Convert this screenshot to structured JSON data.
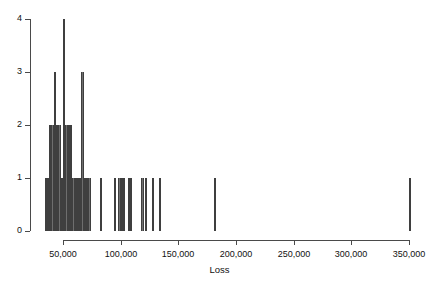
{
  "chart_data": {
    "type": "bar",
    "title": "",
    "subtitle": "",
    "xlabel": "Loss",
    "ylabel": "",
    "legend": [],
    "legend_position": "none",
    "grid": false,
    "xlim": [
      32000,
      356000
    ],
    "ylim": [
      0,
      4
    ],
    "x_ticks": [
      50000,
      100000,
      150000,
      200000,
      250000,
      300000,
      350000
    ],
    "x_tick_labels": [
      "50,000",
      "100,000",
      "150,000",
      "200,000",
      "250,000",
      "300,000",
      "350,000"
    ],
    "y_ticks": [
      0,
      1,
      2,
      3,
      4
    ],
    "y_tick_labels": [
      "0",
      "1",
      "2",
      "3",
      "4"
    ],
    "bar_color": "#6e6e6e",
    "bar_edge_color": "#3f3f3f",
    "axis_color": "#4a4a4a",
    "text_color": "#111111",
    "bin_width": 2000,
    "bins": [
      {
        "x": 34000,
        "value": 1
      },
      {
        "x": 36000,
        "value": 1
      },
      {
        "x": 38000,
        "value": 2
      },
      {
        "x": 40000,
        "value": 2
      },
      {
        "x": 42000,
        "value": 3
      },
      {
        "x": 44000,
        "value": 2
      },
      {
        "x": 46000,
        "value": 2
      },
      {
        "x": 48000,
        "value": 1
      },
      {
        "x": 50000,
        "value": 4
      },
      {
        "x": 52000,
        "value": 2
      },
      {
        "x": 54000,
        "value": 2
      },
      {
        "x": 56000,
        "value": 2
      },
      {
        "x": 58000,
        "value": 1
      },
      {
        "x": 60000,
        "value": 1
      },
      {
        "x": 62000,
        "value": 1
      },
      {
        "x": 64000,
        "value": 1
      },
      {
        "x": 66000,
        "value": 3
      },
      {
        "x": 68000,
        "value": 1
      },
      {
        "x": 70000,
        "value": 1
      },
      {
        "x": 72000,
        "value": 1
      },
      {
        "x": 82000,
        "value": 1
      },
      {
        "x": 94000,
        "value": 1
      },
      {
        "x": 98000,
        "value": 1
      },
      {
        "x": 100000,
        "value": 1
      },
      {
        "x": 102000,
        "value": 1
      },
      {
        "x": 106000,
        "value": 1
      },
      {
        "x": 108000,
        "value": 1
      },
      {
        "x": 118000,
        "value": 1
      },
      {
        "x": 121000,
        "value": 1
      },
      {
        "x": 127000,
        "value": 1
      },
      {
        "x": 133000,
        "value": 1
      },
      {
        "x": 181000,
        "value": 1
      },
      {
        "x": 350000,
        "value": 1
      }
    ]
  },
  "axis": {
    "x_title": "Loss"
  }
}
